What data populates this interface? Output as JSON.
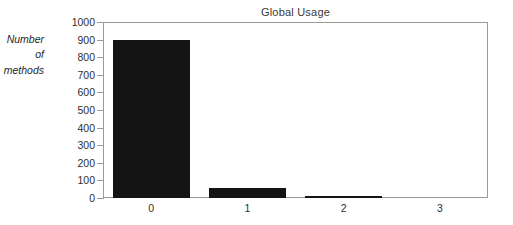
{
  "chart_data": {
    "type": "bar",
    "title": "Global Usage",
    "xlabel": "",
    "ylabel": "Number of methods",
    "ylabel_lines": [
      "Number",
      "of",
      "methods"
    ],
    "categories": [
      "0",
      "1",
      "2",
      "3"
    ],
    "values": [
      900,
      57,
      10,
      0
    ],
    "ylim": [
      0,
      1000
    ],
    "ytick_values": [
      0,
      100,
      200,
      300,
      400,
      500,
      600,
      700,
      800,
      900,
      1000
    ],
    "ytick_labels": [
      "0",
      "100",
      "200",
      "300",
      "400",
      "500",
      "600",
      "700",
      "800",
      "900",
      "1000"
    ],
    "grid": false,
    "legend": null,
    "bar_color": "#141414",
    "frame_color": "#9a9a9a",
    "text_color": "#303030"
  }
}
